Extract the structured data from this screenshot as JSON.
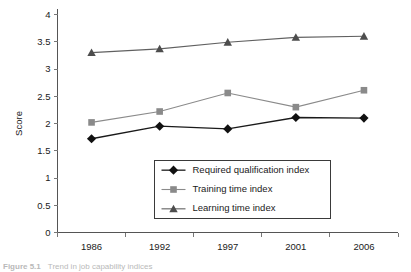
{
  "chart_data": {
    "type": "line",
    "title": "",
    "xlabel": "",
    "ylabel": "Score",
    "categories": [
      "1986",
      "1992",
      "1997",
      "2001",
      "2006"
    ],
    "ylim": [
      0,
      4
    ],
    "ytick_step": 0.5,
    "yticks": [
      "0",
      "0.5",
      "1",
      "1.5",
      "2",
      "2.5",
      "3",
      "3.5",
      "4"
    ],
    "grid": false,
    "legend_position": "inside-lower-center",
    "series": [
      {
        "name": "Required qualification index",
        "marker": "diamond",
        "color": "#111111",
        "line_color": "#1a1a1a",
        "values": [
          1.72,
          1.95,
          1.9,
          2.11,
          2.1
        ]
      },
      {
        "name": "Training time index",
        "marker": "square",
        "color": "#8a8a8a",
        "line_color": "#8a8a8a",
        "values": [
          2.02,
          2.22,
          2.56,
          2.3,
          2.61
        ]
      },
      {
        "name": "Learning time index",
        "marker": "triangle",
        "color": "#4d4d4d",
        "line_color": "#606060",
        "values": [
          3.3,
          3.37,
          3.49,
          3.58,
          3.6
        ]
      }
    ]
  },
  "caption": {
    "number": "Figure 5.1",
    "text": "Trend in job capability indices"
  }
}
